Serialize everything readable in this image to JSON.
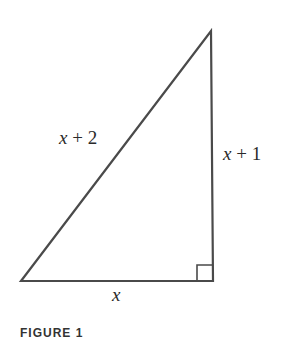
{
  "figure": {
    "shape": "right-triangle",
    "labels": {
      "hypotenuse": {
        "var": "x",
        "op": " + ",
        "num": "2"
      },
      "vertical_leg": {
        "var": "x",
        "op": " + ",
        "num": "1"
      },
      "base": {
        "var": "x"
      }
    },
    "right_angle_marker": true,
    "caption": "FIGURE 1",
    "stroke_color": "#4a4a4a"
  }
}
